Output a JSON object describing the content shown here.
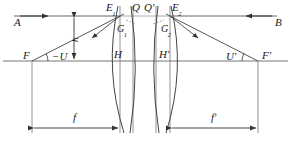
{
  "figure": {
    "type": "optical-ray-diagram",
    "background": "#ffffff",
    "line_color": "#333333",
    "axis_color": "#555555"
  },
  "labels": {
    "incident_ray_left": "A",
    "incident_ray_right": "B",
    "front_focal_point": "F",
    "back_focal_point": "F'",
    "front_principal_point": "H",
    "back_principal_point": "H'",
    "angle_front": "−U",
    "angle_back": "U'",
    "ray_height": "h",
    "surface_vertex_left": "E",
    "surface_vertex_left_sub": "1",
    "surface_vertex_right": "E",
    "surface_vertex_right_sub": "2",
    "inner_point_left": "Q",
    "inner_point_right": "Q'",
    "glass_left": "G",
    "glass_left_sub": "1",
    "glass_right": "G",
    "glass_right_sub": "2",
    "focal_length_front": "f",
    "focal_length_back": "f'"
  },
  "geometry": {
    "axis_y": 61,
    "ray_y": 16,
    "left_focus_x": 32,
    "right_focus_x": 258,
    "left_principal_x": 112,
    "right_principal_x": 178,
    "canvas_width": 291,
    "canvas_height": 148,
    "dimension_y": 128,
    "f_value_label": "f",
    "f_prime_value_label": "f'"
  }
}
